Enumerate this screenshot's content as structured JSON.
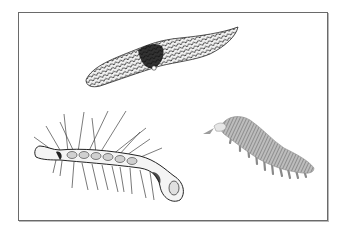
{
  "plate": {
    "background": "#ffffff",
    "border_color": "#6a6a6a",
    "figures": [
      {
        "name": "scaly-slug-creature",
        "position": "top-center",
        "style": "dark crosshatched scales"
      },
      {
        "name": "spiny-worm-creature",
        "position": "bottom-left",
        "style": "line drawing with long spines and legs"
      },
      {
        "name": "velvet-worm-creature",
        "position": "bottom-right",
        "style": "grey annulated body with stubby legs"
      }
    ]
  }
}
